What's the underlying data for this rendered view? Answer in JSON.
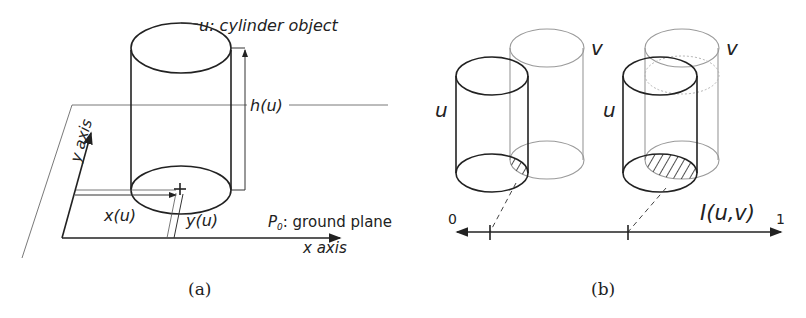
{
  "panel_a": {
    "caption": "(a)",
    "object_label": "u: cylinder object",
    "height_label": "h(u)",
    "x_coord_label": "x(u)",
    "y_coord_label": "y(u)",
    "plane_label_sym": "P",
    "plane_label_sub": "0",
    "plane_label_rest": ": ground plane",
    "x_axis_label": "x axis",
    "y_axis_label": "y axis"
  },
  "panel_b": {
    "caption": "(b)",
    "left_pair": {
      "u_label": "u",
      "v_label": "v"
    },
    "right_pair": {
      "u_label": "u",
      "v_label": "v"
    },
    "scale": {
      "min_label": "0",
      "max_label": "1",
      "measure_label": "I(u,v)"
    }
  },
  "colors": {
    "ink": "#222222",
    "ghost_cylinder": "#9a9a9a",
    "background": "#ffffff"
  }
}
